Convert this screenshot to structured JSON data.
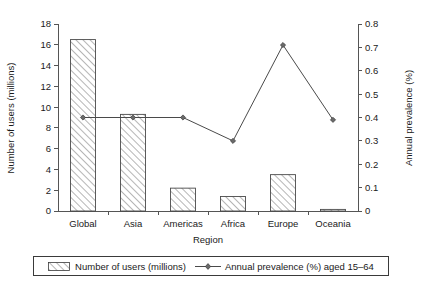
{
  "chart_data": {
    "type": "bar",
    "title": "",
    "subtitle": "",
    "xlabel": "Region",
    "ylabel": "Number of users (millions)",
    "y2label": "Annual prevalence (%)",
    "categories": [
      "Global",
      "Asia",
      "Americas",
      "Africa",
      "Europe",
      "Oceania"
    ],
    "ylim": [
      0,
      18
    ],
    "y2lim": [
      0,
      0.8
    ],
    "yticks": [
      "0",
      "2",
      "4",
      "6",
      "8",
      "10",
      "12",
      "14",
      "16",
      "18"
    ],
    "y2ticks": [
      "0",
      "0.1",
      "0.2",
      "0.3",
      "0.4",
      "0.5",
      "0.6",
      "0.7",
      "0.8"
    ],
    "ytick_values": [
      0,
      2,
      4,
      6,
      8,
      10,
      12,
      14,
      16,
      18
    ],
    "y2tick_values": [
      0,
      0.1,
      0.2,
      0.3,
      0.4,
      0.5,
      0.6,
      0.7,
      0.8
    ],
    "grid": false,
    "legend_position": "bottom",
    "series": [
      {
        "name": "Number of users (millions)",
        "type": "bar",
        "axis": "left",
        "values": [
          16.5,
          9.3,
          2.2,
          1.4,
          3.5,
          0.05
        ]
      },
      {
        "name": "Annual prevalence (%) aged 15–64",
        "type": "line",
        "axis": "right",
        "values": [
          0.4,
          0.4,
          0.4,
          0.3,
          0.71,
          0.39
        ]
      }
    ]
  },
  "legend": {
    "items": [
      {
        "label": "Number of users (millions)",
        "marker": "hatched-swatch-icon"
      },
      {
        "label": "Annual prevalence (%) aged 15–64",
        "marker": "line-diamond-marker-icon"
      }
    ]
  },
  "colors": {
    "axis": "#555555",
    "bar_edge": "#4a4a4a",
    "bar_hatch": "#6e6e6e",
    "line": "#4a4a4a",
    "marker_fill": "#6a6a6a",
    "text": "#1a1a1a",
    "background": "#ffffff"
  }
}
